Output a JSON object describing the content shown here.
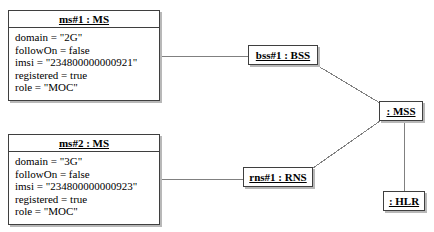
{
  "diagram": {
    "kind": "uml-object-diagram",
    "line_color": "#808080",
    "border_color": "#3f3f3f",
    "shadow_color": "#b8b8b8",
    "background": "#ffffff"
  },
  "objects": [
    {
      "id": "ms1",
      "title": "ms#1 : MS",
      "attributes": [
        "domain = \"2G\"",
        "followOn = false",
        "imsi = \"234800000000921\"",
        "registered = true",
        "role = \"MOC\""
      ]
    },
    {
      "id": "ms2",
      "title": "ms#2 : MS",
      "attributes": [
        "domain = \"3G\"",
        "followOn = false",
        "imsi = \"234800000000923\"",
        "registered = true",
        "role = \"MOC\""
      ]
    }
  ],
  "nodes": [
    {
      "id": "bss",
      "label": "bss#1 : BSS"
    },
    {
      "id": "rns",
      "label": "rns#1 : RNS"
    },
    {
      "id": "mss",
      "label": ": MSS"
    },
    {
      "id": "hlr",
      "label": ": HLR"
    }
  ],
  "links": [
    {
      "from": "ms1",
      "to": "bss",
      "x1": 161,
      "y1": 56,
      "x2": 248,
      "y2": 56
    },
    {
      "from": "ms2",
      "to": "rns",
      "x1": 161,
      "y1": 179,
      "x2": 243,
      "y2": 179
    },
    {
      "from": "bss",
      "to": "mss",
      "x1": 318,
      "y1": 66,
      "x2": 380,
      "y2": 103
    },
    {
      "from": "rns",
      "to": "mss",
      "x1": 313,
      "y1": 168,
      "x2": 380,
      "y2": 121
    },
    {
      "from": "mss",
      "to": "hlr",
      "x1": 404,
      "y1": 122,
      "x2": 404,
      "y2": 191
    }
  ]
}
